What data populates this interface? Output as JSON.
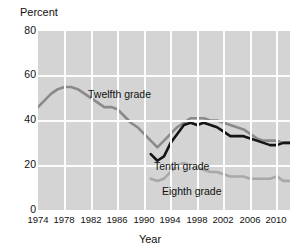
{
  "chart_data": {
    "type": "line",
    "title": "",
    "xlabel": "Year",
    "ylabel": "Percent",
    "ylim": [
      0,
      80
    ],
    "xlim": [
      1974,
      2012
    ],
    "grid": true,
    "legend_position": "inline-labels",
    "yticks": [
      80,
      60,
      40,
      20,
      0
    ],
    "xticks": [
      1974,
      1978,
      1982,
      1986,
      1990,
      1994,
      1998,
      2002,
      2006,
      2010
    ],
    "x": [
      1974,
      1975,
      1976,
      1977,
      1978,
      1979,
      1980,
      1981,
      1982,
      1983,
      1984,
      1985,
      1986,
      1987,
      1988,
      1989,
      1990,
      1991,
      1992,
      1993,
      1994,
      1995,
      1996,
      1997,
      1998,
      1999,
      2000,
      2001,
      2002,
      2003,
      2004,
      2005,
      2006,
      2007,
      2008,
      2009,
      2010,
      2011,
      2012
    ],
    "series": [
      {
        "name": "Twelfth grade",
        "color": "#8a8a8a",
        "values": [
          46,
          49,
          52,
          54,
          55,
          55,
          54,
          52,
          50,
          48,
          46,
          46,
          45,
          42,
          39,
          37,
          34,
          31,
          28,
          31,
          34,
          37,
          39,
          41,
          41,
          41,
          40,
          40,
          39,
          38,
          37,
          36,
          34,
          32,
          31,
          31,
          31,
          30,
          30
        ]
      },
      {
        "name": "Tenth grade",
        "color": "#141414",
        "values": [
          null,
          null,
          null,
          null,
          null,
          null,
          null,
          null,
          null,
          null,
          null,
          null,
          null,
          null,
          null,
          null,
          null,
          25,
          22,
          24,
          30,
          34,
          38,
          39,
          38,
          39,
          38,
          37,
          35,
          33,
          33,
          33,
          32,
          31,
          30,
          29,
          29,
          30,
          30
        ]
      },
      {
        "name": "Eighth grade",
        "color": "#a8a8a8",
        "values": [
          null,
          null,
          null,
          null,
          null,
          null,
          null,
          null,
          null,
          null,
          null,
          null,
          null,
          null,
          null,
          null,
          null,
          14,
          13,
          14,
          17,
          20,
          21,
          20,
          19,
          18,
          17,
          17,
          16,
          15,
          15,
          15,
          14,
          14,
          14,
          14,
          15,
          13,
          13
        ]
      }
    ]
  },
  "axes": {
    "ylabel": "Percent",
    "xlabel": "Year"
  },
  "labels": {
    "twelfth": "Twelfth grade",
    "tenth": "Tenth grade",
    "eighth": "Eighth grade"
  },
  "yticks": {
    "t0": "80",
    "t1": "60",
    "t2": "40",
    "t3": "20",
    "t4": "0"
  },
  "xticks": {
    "t0": "1974",
    "t1": "1978",
    "t2": "1982",
    "t3": "1986",
    "t4": "1990",
    "t5": "1994",
    "t6": "1998",
    "t7": "2002",
    "t8": "2006",
    "t9": "2010"
  },
  "colors": {
    "plot_background": "#d4d4d4",
    "gridline": "#fdfdfd",
    "twelfth": "#8a8a8a",
    "tenth": "#141414",
    "eighth": "#a8a8a8",
    "page_background": "#ffffff",
    "text": "#111111"
  }
}
